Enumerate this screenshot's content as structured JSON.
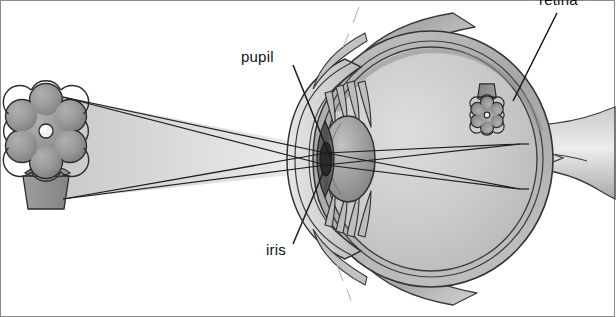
{
  "figure": {
    "background_color": "#ffffff",
    "border_color": "#8a8a8a",
    "width": 615,
    "height": 317
  },
  "labels": {
    "pupil": "pupil",
    "iris": "iris",
    "retina": "retina"
  },
  "palette": {
    "ink": "#1a1a1a",
    "sclera_outer": "#b4b4b4",
    "sclera_mid": "#9a9a9a",
    "vitreous": "#c9c9c9",
    "vitreous_light": "#d8d8d8",
    "cornea": "#d2d2d2",
    "lens": "#a8a8a8",
    "lens_dark": "#8d8d8d",
    "iris_dark": "#5f5f5f",
    "pupil": "#2e2e2e",
    "flower": "#9b9b9b",
    "flower_center": "#efefef",
    "pot": "#8f8f8f",
    "light_cone": "#dcdcdc",
    "muscle": "#b0b0b0",
    "optic_nerve": "#bdbdbd",
    "ray_line": "#1f1f1f"
  },
  "anatomy": {
    "parts": [
      "cornea",
      "iris",
      "pupil",
      "lens",
      "ciliary fibers",
      "vitreous humor",
      "retina",
      "sclera",
      "optic nerve",
      "extraocular muscle"
    ]
  },
  "scene": {
    "object": {
      "name": "potted flower",
      "orientation": "upright",
      "petals": 6,
      "position": "left of eye"
    },
    "image": {
      "name": "retinal image of flower",
      "orientation": "inverted",
      "petals": 6,
      "position": "on retina at right rear of eye"
    },
    "light_rays": {
      "count": 4,
      "description": "two ray pairs from top and bottom of object crossing at the pupil"
    }
  }
}
